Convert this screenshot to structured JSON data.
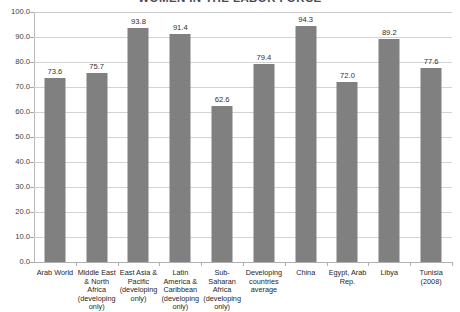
{
  "chart_data": {
    "type": "bar",
    "title": "WOMEN IN THE LABOR FORCE",
    "xlabel": "",
    "ylabel": "",
    "ylim": [
      0.0,
      100.0
    ],
    "ytick_step": 10.0,
    "grid": true,
    "legend": false,
    "bar_color": "#808080",
    "gridline_color": "#d3d3d3",
    "categories": [
      "Arab World",
      "Middle East & North Africa (developing only)",
      "East Asia & Pacific (developing only)",
      "Latin America & Caribbean (developing only)",
      "Sub-Saharan Africa (developing only)",
      "Developing countries average",
      "China",
      "Egypt, Arab Rep.",
      "Libya",
      "Tunisia (2008)"
    ],
    "values": [
      73.6,
      75.7,
      93.8,
      91.4,
      62.6,
      79.4,
      94.3,
      72.0,
      89.2,
      77.6
    ],
    "value_labels": [
      "73.6",
      "75.7",
      "93.8",
      "91.4",
      "62.6",
      "79.4",
      "94.3",
      "72.0",
      "89.2",
      "77.6"
    ],
    "ytick_labels": [
      "100.0",
      "90.0",
      "80.0",
      "70.0",
      "60.0",
      "50.0",
      "40.0",
      "30.0",
      "20.0",
      "10.0",
      "0.0"
    ],
    "ytick_values": [
      100.0,
      90.0,
      80.0,
      70.0,
      60.0,
      50.0,
      40.0,
      30.0,
      20.0,
      10.0,
      0.0
    ]
  }
}
